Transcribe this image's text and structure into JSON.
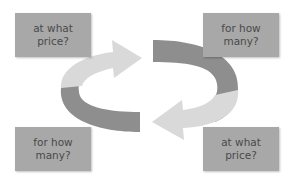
{
  "diagram": {
    "type": "cycle",
    "colors": {
      "box_fill": "#a8a8a8",
      "box_text": "#4a4a4a",
      "arrow_light": "#d9d9d9",
      "arrow_dark": "#8e8e8e"
    },
    "boxes": [
      {
        "id": "top-left",
        "line1": "at what",
        "line2": "price?"
      },
      {
        "id": "top-right",
        "line1": "for how",
        "line2": "many?"
      },
      {
        "id": "bottom-left",
        "line1": "for how",
        "line2": "many?"
      },
      {
        "id": "bottom-right",
        "line1": "at what",
        "line2": "price?"
      }
    ],
    "arrows": [
      {
        "name": "light-arrow-pointing-right",
        "shade": "light"
      },
      {
        "name": "dark-band-right",
        "shade": "dark"
      },
      {
        "name": "light-arrow-pointing-left",
        "shade": "light"
      },
      {
        "name": "dark-band-left",
        "shade": "dark"
      }
    ]
  }
}
